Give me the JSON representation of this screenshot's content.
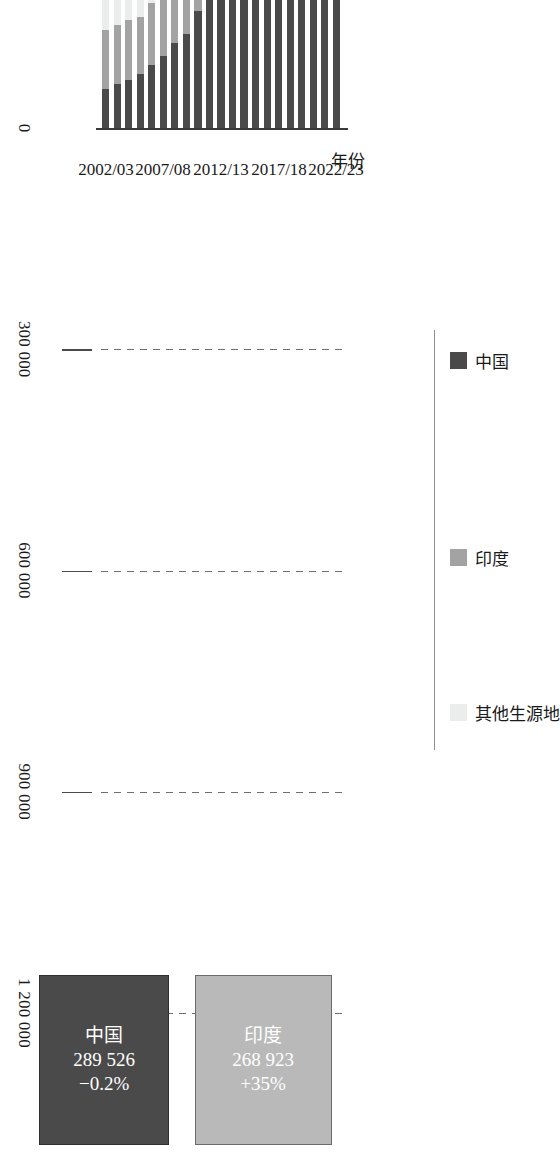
{
  "chart_data": {
    "type": "bar",
    "subtype": "stacked-horizontal",
    "title": "",
    "xlabel": "",
    "ylabel": "年份",
    "categories": [
      "2002/03",
      "2003/04",
      "2004/05",
      "2005/06",
      "2006/07",
      "2007/08",
      "2008/09",
      "2009/10",
      "2010/11",
      "2011/12",
      "2012/13",
      "2013/14",
      "2014/15",
      "2015/16",
      "2016/17",
      "2017/18",
      "2018/19",
      "2019/20",
      "2020/21",
      "2021/22",
      "2022/23"
    ],
    "tick_labels": [
      "0",
      "300 000",
      "600 000",
      "900 000",
      "1 200 000"
    ],
    "tick_values": [
      0,
      300000,
      600000,
      900000,
      1200000
    ],
    "xlim": [
      0,
      1200000
    ],
    "grid": true,
    "grid_style": "dashed",
    "legend_position": "left",
    "series": [
      {
        "name": "中国",
        "key": "china",
        "color": "#4a4a4a",
        "values": [
          53000,
          59000,
          65000,
          73000,
          85000,
          98000,
          115000,
          128000,
          158000,
          195000,
          236000,
          275000,
          305000,
          329000,
          351000,
          363000,
          370000,
          372000,
          355000,
          291000,
          290000
        ]
      },
      {
        "name": "印度",
        "key": "india",
        "color": "#a3a3a3",
        "values": [
          80000,
          80000,
          81000,
          77000,
          84000,
          95000,
          105000,
          105000,
          104000,
          101000,
          97000,
          103000,
          133000,
          166000,
          186000,
          196000,
          202000,
          194000,
          167000,
          199000,
          269000
        ]
      },
      {
        "name": "其他生源地",
        "key": "other",
        "color": "#ebecec",
        "values": [
          453000,
          433000,
          419000,
          415000,
          413000,
          430000,
          451000,
          457000,
          462000,
          467000,
          486000,
          508000,
          535000,
          548000,
          541000,
          535000,
          523000,
          509000,
          392000,
          458000,
          499000
        ]
      }
    ]
  },
  "axis": {
    "value_axis_title": "",
    "category_axis_title": "年份",
    "visible_category_labels": [
      "2002/03",
      "2007/08",
      "2012/13",
      "2017/18",
      "2022/23"
    ]
  },
  "legend": {
    "items": [
      {
        "label": "中国",
        "key": "china"
      },
      {
        "label": "印度",
        "key": "india"
      },
      {
        "label": "其他生源地",
        "key": "other"
      }
    ]
  },
  "callouts": [
    {
      "key": "india",
      "name": "印度",
      "value": "268 923",
      "change": "+35%"
    },
    {
      "key": "china",
      "name": "中国",
      "value": "289 526",
      "change": "−0.2%"
    }
  ],
  "colors": {
    "china": "#4a4a4a",
    "india": "#a3a3a3",
    "other": "#ebecec",
    "axis": "#3a3a3a",
    "grid": "#6f6f6f",
    "text": "#1a1a1a"
  }
}
